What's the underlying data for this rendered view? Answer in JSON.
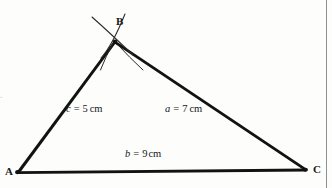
{
  "figure": {
    "type": "geometry-construction-diagram",
    "background_color": "#fdfdfc",
    "line_color": "#121212",
    "vertices": [
      {
        "name": "A",
        "label": "A",
        "x": 17,
        "y": 172,
        "label_x": 5,
        "label_y": 167
      },
      {
        "name": "B",
        "label": "B",
        "x": 115,
        "y": 41,
        "label_x": 116,
        "label_y": 17
      },
      {
        "name": "C",
        "label": "C",
        "x": 306,
        "y": 170,
        "label_x": 313,
        "label_y": 165
      }
    ],
    "sides": [
      {
        "name": "side-c",
        "from": "A",
        "to": "B",
        "symbol": "c",
        "equals": "=",
        "value": "5",
        "unit": "cm",
        "text": "c = 5 cm",
        "label_x": 66,
        "label_y": 104
      },
      {
        "name": "side-a",
        "from": "B",
        "to": "C",
        "symbol": "a",
        "equals": "=",
        "value": "7",
        "unit": "cm",
        "text": "a = 7 cm",
        "label_x": 165,
        "label_y": 104
      },
      {
        "name": "side-b",
        "from": "A",
        "to": "C",
        "symbol": "b",
        "equals": "=",
        "value": "9",
        "unit": "cm",
        "text": "b = 9 cm",
        "label_x": 125,
        "label_y": 150
      }
    ],
    "construction_arcs": [
      {
        "name": "arc-from-A",
        "note": "compass arc radius c = 5 cm swung from A, crossing through B"
      },
      {
        "name": "arc-from-C",
        "note": "compass arc radius a = 7 cm swung from C, crossing through B"
      }
    ],
    "margin_artifact": "."
  }
}
